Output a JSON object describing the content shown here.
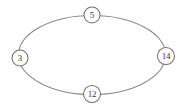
{
  "diagram": {
    "type": "cycle-graph",
    "title": "",
    "background_color": "#ffffff",
    "edge_color": "#8a8a8a",
    "node_stroke_color": "#6f6f6f",
    "node_fill_color": "#ffffff",
    "label_color": "#3a3a3a",
    "shape": "ellipse",
    "ellipse": {
      "center_x": 92,
      "center_y": 55,
      "radius_x": 74,
      "radius_y": 40
    },
    "nodes": [
      {
        "id": "node-top",
        "label": "5",
        "position": "top",
        "cx": 92,
        "cy": 15,
        "r": 8
      },
      {
        "id": "node-right",
        "label": "14",
        "position": "right",
        "cx": 166,
        "cy": 56,
        "r": 8.5
      },
      {
        "id": "node-bottom",
        "label": "12",
        "position": "bottom",
        "cx": 92,
        "cy": 94,
        "r": 8.5
      },
      {
        "id": "node-left",
        "label": "3",
        "position": "left",
        "cx": 20,
        "cy": 58,
        "r": 8
      }
    ]
  }
}
